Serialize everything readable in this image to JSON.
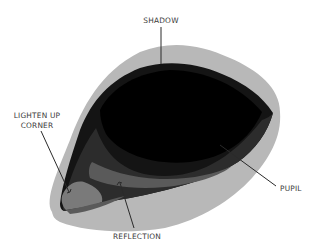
{
  "figure": {
    "colors": {
      "background": "#ffffff",
      "shadow_halo": "#b8b8b8",
      "eye_body": "#141414",
      "pupil": "#000000",
      "lower_band": "#2c2c2c",
      "reflection_band": "#5a5a5a",
      "corner_light": "#7a7a7a",
      "annotation_line": "#2a2a2a",
      "label_text": "#3a3a3a"
    }
  },
  "annotations": [
    {
      "id": "shadow",
      "lines": [
        "SHADOW"
      ]
    },
    {
      "id": "lighten-up-corner",
      "lines": [
        "LIGHTEN UP",
        "CORNER"
      ]
    },
    {
      "id": "pupil",
      "lines": [
        "PUPIL"
      ]
    },
    {
      "id": "reflection",
      "lines": [
        "REFLECTION"
      ]
    }
  ]
}
